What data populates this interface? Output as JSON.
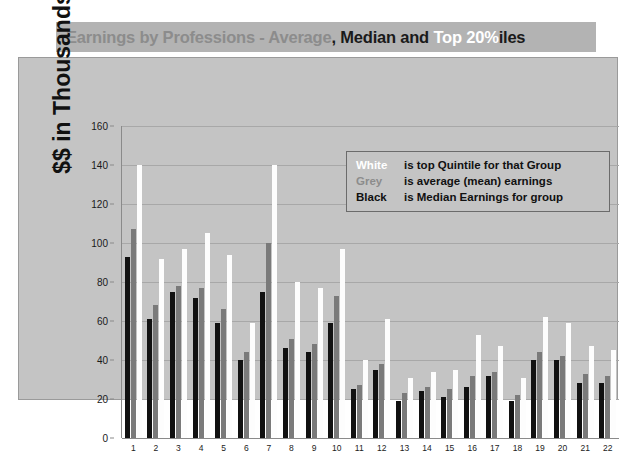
{
  "title": {
    "part_1": "Earnings by Professions - ",
    "part_average": "Average",
    "part_2": ", ",
    "part_median": "Median",
    "part_3": " and ",
    "part_top": "Top 20%",
    "part_4": "iles",
    "full": "Earnings by Professions - Average, Median and Top 20%iles"
  },
  "legend": {
    "rows": [
      {
        "key": "White",
        "desc": "is top Quintile for that Group",
        "color": "#ffffff"
      },
      {
        "key": "Grey",
        "desc": "is average (mean) earnings",
        "color": "#8c8c8c"
      },
      {
        "key": "Black",
        "desc": "is Median Earnings for group",
        "color": "#111111"
      }
    ]
  },
  "colors": {
    "title_bar": "#b3b3b3",
    "plot_background": "#c4c4c4",
    "gridline": "#a8a8a8",
    "bar_black": "#111111",
    "bar_grey": "#7a7a7a",
    "bar_white": "#fdfdfd"
  },
  "chart_data": {
    "type": "bar",
    "title": "Earnings by Professions - Average, Median and Top 20%iles",
    "xlabel": "",
    "ylabel": "$$ in Thousands",
    "ylim": [
      0,
      160
    ],
    "yticks": [
      0,
      20,
      40,
      60,
      80,
      100,
      120,
      140,
      160
    ],
    "grid": true,
    "legend_position": "top-right inside plot",
    "categories": [
      "1",
      "2",
      "3",
      "4",
      "5",
      "6",
      "7",
      "8",
      "9",
      "10",
      "11",
      "12",
      "13",
      "14",
      "15",
      "16",
      "17",
      "18",
      "19",
      "20",
      "21",
      "22"
    ],
    "series": [
      {
        "name": "Median Earnings for group",
        "color": "#111111",
        "values": [
          93,
          61,
          75,
          72,
          59,
          40,
          75,
          46,
          44,
          59,
          25,
          35,
          19,
          24,
          21,
          26,
          32,
          19,
          40,
          40,
          28,
          28
        ]
      },
      {
        "name": "Average (mean) earnings",
        "color": "#7a7a7a",
        "values": [
          107,
          68,
          78,
          77,
          66,
          44,
          100,
          51,
          48,
          73,
          27,
          38,
          23,
          26,
          25,
          32,
          34,
          22,
          44,
          42,
          33,
          32
        ]
      },
      {
        "name": "Top Quintile for that Group",
        "color": "#fdfdfd",
        "values": [
          140,
          92,
          97,
          105,
          94,
          59,
          140,
          80,
          77,
          97,
          40,
          61,
          31,
          34,
          35,
          53,
          47,
          31,
          62,
          59,
          47,
          45
        ]
      }
    ]
  }
}
